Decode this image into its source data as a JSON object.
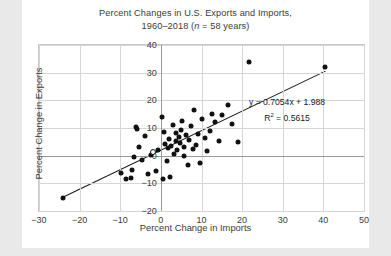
{
  "figure": {
    "title_line1": "Percent Changes in U.S. Exports and Imports,",
    "title_line2_pre": "1960–2018 (",
    "title_line2_ital": "n",
    "title_line2_post": " = 58 years)",
    "background": "#ffffff",
    "page_background": "#e9e9e9",
    "point_color": "#111111",
    "grid_color": "#d6d6d6",
    "axis_color": "#9a9a9a"
  },
  "annotations": {
    "equation": "y = 0.7054x + 1.988",
    "r_squared_pre": "R",
    "r_squared_sup": "2",
    "r_squared_post": " = 0.5615"
  },
  "chart_data": {
    "type": "scatter",
    "title": "Percent Changes in U.S. Exports and Imports, 1960–2018 (n = 58 years)",
    "xlabel": "Percent Change in Imports",
    "ylabel": "Percent Change in Exports",
    "xlim": [
      -30,
      50
    ],
    "ylim": [
      -20,
      40
    ],
    "xticks": [
      -30,
      -20,
      -10,
      0,
      10,
      20,
      30,
      40,
      50
    ],
    "yticks": [
      -20,
      -10,
      0,
      10,
      20,
      30,
      40
    ],
    "xtick_labels": [
      "−30",
      "−20",
      "−10",
      "0",
      "10",
      "20",
      "30",
      "40",
      "50"
    ],
    "ytick_labels": [
      "−20",
      "−10",
      "0",
      "10",
      "20",
      "30",
      "40"
    ],
    "grid": true,
    "legend": "none",
    "n": 58,
    "trendline": {
      "slope": 0.7054,
      "intercept": 1.988,
      "r_squared": 0.5615,
      "x_start": -24.0,
      "x_end": 40.5,
      "label": "y = 0.7054x + 1.988",
      "r2_label": "R² = 0.5615"
    },
    "points": [
      {
        "x": -24.0,
        "y": -15.2,
        "filled": true
      },
      {
        "x": -9.8,
        "y": -6.2,
        "filled": true
      },
      {
        "x": -8.6,
        "y": -8.4,
        "filled": true
      },
      {
        "x": -7.4,
        "y": -7.9,
        "filled": true
      },
      {
        "x": -7.2,
        "y": -5.2,
        "filled": true
      },
      {
        "x": -6.6,
        "y": -0.4,
        "filled": true
      },
      {
        "x": -6.2,
        "y": 10.3,
        "filled": true
      },
      {
        "x": -6.0,
        "y": 9.6,
        "filled": true
      },
      {
        "x": -5.4,
        "y": 3.1,
        "filled": true
      },
      {
        "x": -4.6,
        "y": -1.5,
        "filled": true
      },
      {
        "x": -4.0,
        "y": 7.2,
        "filled": true
      },
      {
        "x": -3.2,
        "y": -6.8,
        "filled": true
      },
      {
        "x": -2.4,
        "y": 0.3,
        "filled": true
      },
      {
        "x": -2.0,
        "y": 1.2,
        "filled": true,
        "open": true
      },
      {
        "x": -1.2,
        "y": -5.6,
        "filled": true
      },
      {
        "x": -0.6,
        "y": 2.2,
        "filled": true
      },
      {
        "x": 0.2,
        "y": 14.0,
        "filled": true
      },
      {
        "x": 0.4,
        "y": -8.6,
        "filled": true
      },
      {
        "x": 0.8,
        "y": 8.5,
        "filled": true
      },
      {
        "x": 1.0,
        "y": 4.2,
        "filled": true
      },
      {
        "x": 1.4,
        "y": -2.0,
        "filled": true
      },
      {
        "x": 1.8,
        "y": 2.6,
        "filled": true
      },
      {
        "x": 2.0,
        "y": 6.0,
        "filled": true
      },
      {
        "x": 2.2,
        "y": -7.8,
        "filled": true
      },
      {
        "x": 2.6,
        "y": 3.4,
        "filled": true
      },
      {
        "x": 3.0,
        "y": 11.0,
        "filled": true
      },
      {
        "x": 3.2,
        "y": 0.6,
        "filled": true
      },
      {
        "x": 3.6,
        "y": 5.2,
        "filled": true
      },
      {
        "x": 3.8,
        "y": 8.2,
        "filled": true
      },
      {
        "x": 4.0,
        "y": 2.0,
        "filled": true
      },
      {
        "x": 4.4,
        "y": 6.8,
        "filled": true
      },
      {
        "x": 4.6,
        "y": 4.6,
        "filled": true
      },
      {
        "x": 5.0,
        "y": 9.4,
        "filled": true
      },
      {
        "x": 5.2,
        "y": 12.6,
        "filled": true
      },
      {
        "x": 5.6,
        "y": 3.0,
        "filled": true
      },
      {
        "x": 5.8,
        "y": 0.0,
        "filled": true
      },
      {
        "x": 6.2,
        "y": 7.4,
        "filled": true
      },
      {
        "x": 6.6,
        "y": -3.4,
        "filled": true
      },
      {
        "x": 7.0,
        "y": 5.8,
        "filled": true
      },
      {
        "x": 7.4,
        "y": 10.6,
        "filled": true
      },
      {
        "x": 7.8,
        "y": 2.4,
        "filled": true
      },
      {
        "x": 8.2,
        "y": 16.4,
        "filled": true
      },
      {
        "x": 8.6,
        "y": 4.0,
        "filled": true
      },
      {
        "x": 9.2,
        "y": 7.8,
        "filled": true
      },
      {
        "x": 9.6,
        "y": -2.6,
        "filled": true
      },
      {
        "x": 10.2,
        "y": 13.2,
        "filled": true
      },
      {
        "x": 10.8,
        "y": 6.4,
        "filled": true
      },
      {
        "x": 11.4,
        "y": 1.6,
        "filled": true
      },
      {
        "x": 12.0,
        "y": 9.0,
        "filled": true
      },
      {
        "x": 12.6,
        "y": 15.2,
        "filled": true
      },
      {
        "x": 13.4,
        "y": 12.0,
        "filled": true
      },
      {
        "x": 14.2,
        "y": 5.4,
        "filled": true
      },
      {
        "x": 15.0,
        "y": 14.6,
        "filled": true
      },
      {
        "x": 16.4,
        "y": 18.2,
        "filled": true
      },
      {
        "x": 17.6,
        "y": 11.4,
        "filled": true
      },
      {
        "x": 19.0,
        "y": 5.0,
        "filled": true
      },
      {
        "x": 21.8,
        "y": 34.0,
        "filled": true
      },
      {
        "x": 40.4,
        "y": 32.0,
        "filled": true
      }
    ]
  }
}
